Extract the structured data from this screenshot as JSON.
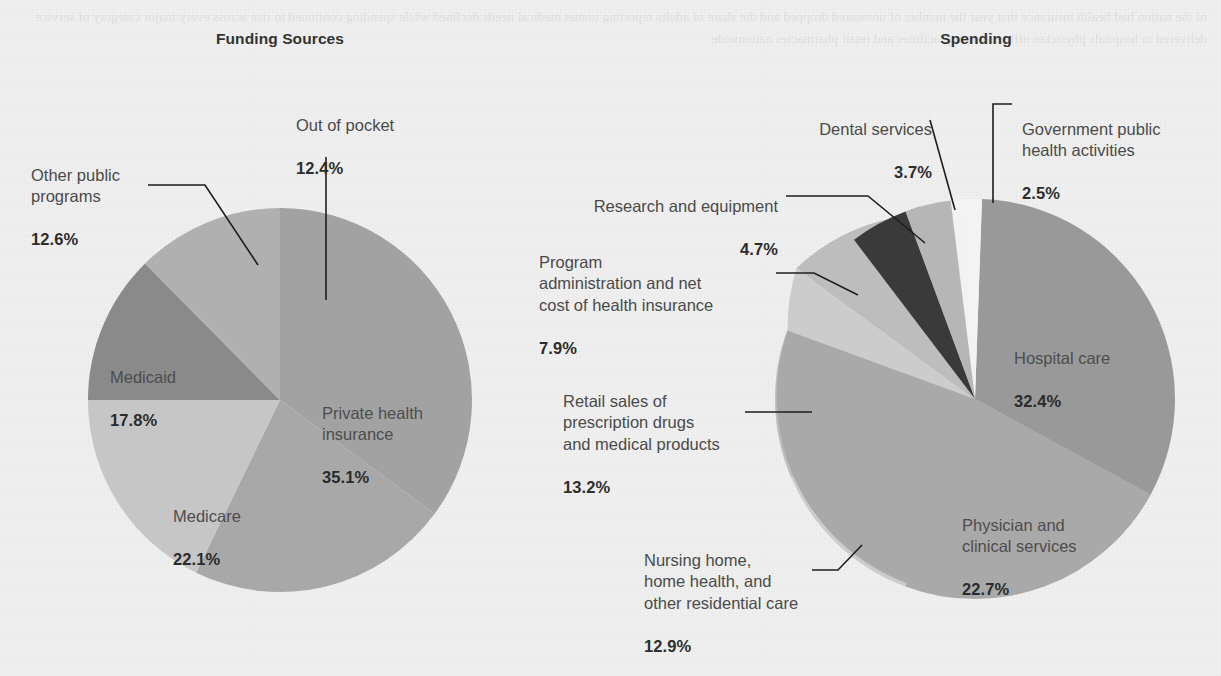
{
  "page": {
    "background_color": "#eeeeee",
    "text_color": "#4a4a4a",
    "bold_text_color": "#2d2d2d"
  },
  "charts": [
    {
      "id": "funding-sources",
      "title": "Funding Sources"
    },
    {
      "id": "spending",
      "title": "Spending"
    }
  ],
  "labels": {
    "funding": {
      "out_of_pocket": {
        "name": "Out of pocket",
        "pct": "12.4%"
      },
      "other_public_programs": {
        "name": "Other public\nprograms",
        "pct": "12.6%"
      },
      "medicaid": {
        "name": "Medicaid",
        "pct": "17.8%"
      },
      "medicare": {
        "name": "Medicare",
        "pct": "22.1%"
      },
      "private_health_insurance": {
        "name": "Private health\ninsurance",
        "pct": "35.1%"
      }
    },
    "spending": {
      "dental_services": {
        "name": "Dental services",
        "pct": "3.7%"
      },
      "government_public_health": {
        "name": "Government public\nhealth activities",
        "pct": "2.5%"
      },
      "research_and_equipment": {
        "name": "Research and equipment",
        "pct": "4.7%"
      },
      "program_administration": {
        "name": "Program\nadministration and net\ncost of health insurance",
        "pct": "7.9%"
      },
      "retail_prescription_drugs": {
        "name": "Retail sales of\nprescription drugs\nand medical products",
        "pct": "13.2%"
      },
      "nursing_home": {
        "name": "Nursing home,\nhome health, and\nother residential care",
        "pct": "12.9%"
      },
      "hospital_care": {
        "name": "Hospital care",
        "pct": "32.4%"
      },
      "physician_clinical": {
        "name": "Physician and\nclinical services",
        "pct": "22.7%"
      }
    }
  },
  "chart_data": [
    {
      "type": "pie",
      "title": "Funding Sources",
      "unit": "percent",
      "center": [
        280,
        400
      ],
      "radius": 192,
      "start_angle_deg": 0,
      "direction": "clockwise",
      "categories": [
        "Private health insurance",
        "Medicare",
        "Medicaid",
        "Other public programs",
        "Out of pocket"
      ],
      "values": [
        35.1,
        22.1,
        17.8,
        12.6,
        12.4
      ],
      "colors": [
        "#a2a2a2",
        "#a8a8a8",
        "#c6c6c6",
        "#8a8a8a",
        "#b0b0b0"
      ],
      "label_positions": [
        "inside",
        "inside",
        "inside",
        "leader",
        "leader"
      ],
      "legend": "none",
      "grid": false
    },
    {
      "type": "pie",
      "title": "Spending",
      "unit": "percent",
      "center": [
        975,
        399
      ],
      "radius": 200,
      "start_angle_deg": 2,
      "direction": "clockwise",
      "categories": [
        "Hospital care",
        "Physician and clinical services",
        "Nursing home, home health, and other residential care",
        "Retail sales of prescription drugs and medical products",
        "Program administration and net cost of health insurance",
        "Research and equipment",
        "Dental services",
        "Government public health activities"
      ],
      "values": [
        32.4,
        22.7,
        12.9,
        13.2,
        7.9,
        4.7,
        3.7,
        2.5
      ],
      "colors": [
        "#999999",
        "#a9a9a9",
        "#cccccc",
        "#bdbdbd",
        "#b4b4b4",
        "#3a3a3a",
        "#b6b6b6",
        "#f2f2f2"
      ],
      "label_positions": [
        "inside",
        "inside",
        "leader",
        "leader",
        "leader",
        "leader",
        "leader",
        "leader"
      ],
      "legend": "none",
      "grid": false
    }
  ],
  "showthrough_text": "of the nation had health insurance that year the number of uninsured dropped and the share of adults reporting unmet medical needs declined while spending continued to rise across every major category of service delivered in hospitals physician offices nursing facilities and retail pharmacies nationwide"
}
